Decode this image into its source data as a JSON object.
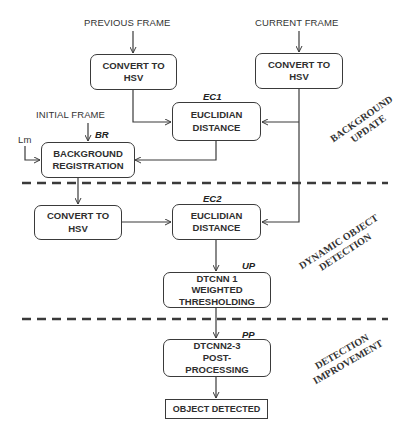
{
  "diagram": {
    "inputs": {
      "previous_frame": "PREVIOUS FRAME",
      "current_frame": "CURRENT FRAME",
      "initial_frame": "INITIAL FRAME",
      "lm": "Lm"
    },
    "blocks": {
      "convert_prev": {
        "line1": "CONVERT TO",
        "line2": "HSV"
      },
      "convert_curr": {
        "line1": "CONVERT TO",
        "line2": "HSV"
      },
      "euclid1": {
        "line1": "EUCLIDIAN",
        "line2": "DISTANCE",
        "tag": "EC1"
      },
      "background_reg": {
        "line1": "BACKGROUND",
        "line2": "REGISTRATION",
        "tag": "BR"
      },
      "convert_bg": {
        "line1": "CONVERT TO",
        "line2": "HSV"
      },
      "euclid2": {
        "line1": "EUCLIDIAN",
        "line2": "DISTANCE",
        "tag": "EC2"
      },
      "dtcnn1": {
        "line1": "DTCNN 1",
        "line2": "WEIGHTED",
        "line3": "THRESHOLDING",
        "tag": "UP"
      },
      "dtcnn23": {
        "line1": "DTCNN2-3",
        "line2": "POST-",
        "line3": "PROCESSING",
        "tag": "PP"
      },
      "output": {
        "label": "OBJECT DETECTED"
      }
    },
    "stages": {
      "stage1": {
        "line1": "BACKGROUND",
        "line2": "UPDATE"
      },
      "stage2": {
        "line1": "DYNAMIC OBJECT",
        "line2": "DETECTION"
      },
      "stage3": {
        "line1": "DETECTION",
        "line2": "IMPROVEMENT"
      }
    },
    "colors": {
      "stroke": "#3a3a3a",
      "text": "#2e2e2e",
      "background": "#ffffff"
    }
  }
}
